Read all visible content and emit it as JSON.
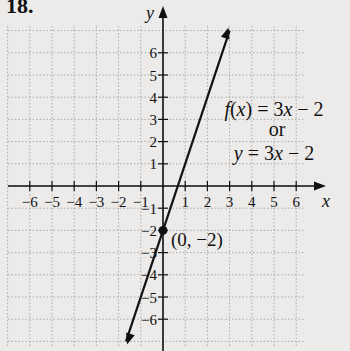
{
  "problem_number": "18.",
  "chart_data": {
    "type": "line",
    "title": "",
    "xlabel": "x",
    "ylabel": "y",
    "xlim": [
      -7,
      7
    ],
    "ylim": [
      -7,
      7
    ],
    "grid": true,
    "x_ticks": [
      -6,
      -5,
      -4,
      -3,
      -2,
      -1,
      1,
      2,
      3,
      4,
      5,
      6
    ],
    "y_ticks": [
      -6,
      -5,
      -4,
      -3,
      -2,
      -1,
      1,
      2,
      3,
      4,
      5,
      6
    ],
    "x_tick_labels": [
      "−6",
      "−5",
      "−4",
      "−3",
      "−2",
      "−1",
      "1",
      "2",
      "3",
      "4",
      "5",
      "6"
    ],
    "y_tick_labels": [
      "−6",
      "−5",
      "−4",
      "−3",
      "−2",
      "−1",
      "1",
      "2",
      "3",
      "4",
      "5",
      "6"
    ],
    "series": [
      {
        "name": "f(x) = 3x − 2",
        "equation_alt": "y = 3x − 2",
        "slope": 3,
        "intercept": -2,
        "x": [
          -1.667,
          3
        ],
        "y": [
          -7,
          7
        ],
        "arrows": "both"
      }
    ],
    "points": [
      {
        "x": 0,
        "y": -2,
        "label": "(0, −2)"
      }
    ],
    "annotations": [
      {
        "text": "f(x) = 3x − 2"
      },
      {
        "text": "or"
      },
      {
        "text": "y = 3x − 2"
      }
    ]
  },
  "labels": {
    "equation_line1": "f(x) = 3x − 2",
    "or": "or",
    "equation_line2": "y = 3x − 2",
    "point_label": "(0, −2)",
    "x_axis": "x",
    "y_axis": "y"
  },
  "colors": {
    "background": "#ecebea",
    "ink": "#111111",
    "grid": "#9a9a9a"
  }
}
